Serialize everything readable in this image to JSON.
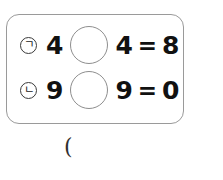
{
  "problem_box": {
    "rows": [
      {
        "marker": "ㄱ",
        "left_operand": "4",
        "operator_blank": "",
        "right_operand": "4",
        "equals": "=",
        "result": "8"
      },
      {
        "marker": "ㄴ",
        "left_operand": "9",
        "operator_blank": "",
        "right_operand": "9",
        "equals": "=",
        "result": "0"
      }
    ]
  },
  "answer_area": {
    "paren": "("
  },
  "colors": {
    "box_border": "#9a9a9a",
    "circle_border": "#8e8e8e",
    "text": "#111111",
    "background": "#ffffff"
  }
}
